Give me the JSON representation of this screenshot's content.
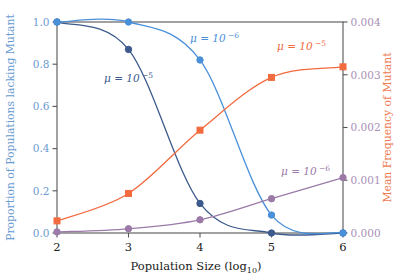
{
  "chart_data": {
    "type": "line",
    "title": "",
    "xlabel": "Population Size (log",
    "xlabel_sub": "10",
    "xlabel_close": ")",
    "ylabel_left": "Proportion of Populations lacking Mutant",
    "ylabel_right": "Mean Frequency of Mutant",
    "x": [
      2,
      3,
      4,
      5,
      6
    ],
    "xticks": [
      "2",
      "3",
      "4",
      "5",
      "6"
    ],
    "xlim": [
      2,
      6
    ],
    "ylim_left": [
      0.0,
      1.0
    ],
    "yticks_left": [
      "0.0",
      "0.2",
      "0.4",
      "0.6",
      "0.8",
      "1.0"
    ],
    "ytick_left_values": [
      0.0,
      0.2,
      0.4,
      0.6,
      0.8,
      1.0
    ],
    "ylim_right": [
      0.0,
      0.004
    ],
    "yticks_right": [
      "0.000",
      "0.001",
      "0.002",
      "0.003",
      "0.004"
    ],
    "ytick_right_values": [
      0.0,
      0.001,
      0.002,
      0.003,
      0.004
    ],
    "grid": false,
    "legend_position": "inline-annotations",
    "series": [
      {
        "name": "proportion-lacking-mu-1e-5",
        "label": "μ = 10",
        "label_exp": "−5",
        "axis": "left",
        "color": "#3c5a8c",
        "marker": "circle",
        "values": [
          1.0,
          0.87,
          0.14,
          0.0,
          0.0
        ],
        "annotation_x": 104,
        "annotation_y": 82
      },
      {
        "name": "proportion-lacking-mu-1e-6",
        "label": "μ = 10",
        "label_exp": "−6",
        "axis": "left",
        "color": "#4a90d9",
        "marker": "circle",
        "values": [
          1.0,
          1.0,
          0.82,
          0.085,
          0.0
        ],
        "annotation_x": 190,
        "annotation_y": 42
      },
      {
        "name": "mean-frequency-mu-1e-5",
        "label": "μ = 10",
        "label_exp": "−5",
        "axis": "right",
        "color": "#f26b3f",
        "marker": "square",
        "values": [
          0.00023,
          0.00075,
          0.00195,
          0.00295,
          0.00315
        ],
        "annotation_x": 277,
        "annotation_y": 50
      },
      {
        "name": "mean-frequency-mu-1e-6",
        "label": "μ = 10",
        "label_exp": "−6",
        "axis": "right",
        "color": "#9b7aa8",
        "marker": "circle",
        "values": [
          2e-05,
          8e-05,
          0.00025,
          0.00065,
          0.00105
        ],
        "annotation_x": 281,
        "annotation_y": 175
      }
    ]
  },
  "colors": {
    "left_axis_text": "#6a9bd1",
    "right_axis_tick_text": "#a98fb5",
    "right_axis_label": "#ef7b52",
    "frame": "#555555",
    "background": "#ffffff"
  }
}
